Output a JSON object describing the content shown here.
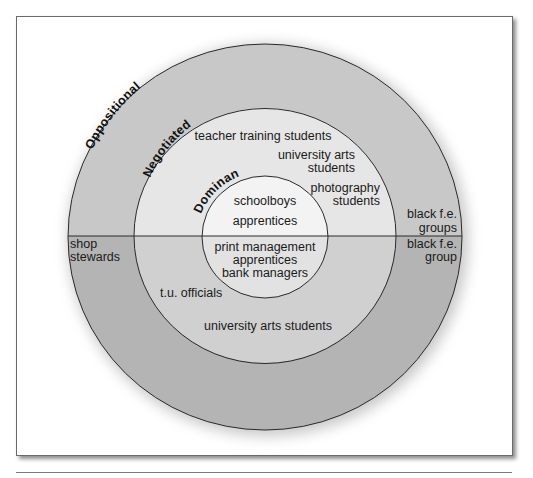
{
  "diagram": {
    "type": "concentric-circles",
    "rings": [
      {
        "name": "Oppositional",
        "label": "Oppositional"
      },
      {
        "name": "Negotiated",
        "label": "Negotiated"
      },
      {
        "name": "Dominant",
        "label": "Dominant"
      }
    ],
    "colors": {
      "outer_top": "#c8c8c8",
      "outer_bottom": "#b4b4b4",
      "middle_top": "#e6e6e6",
      "middle_bottom": "#d0d0d0",
      "inner_top": "#f3f3f3",
      "inner_bottom": "#e2e2e2",
      "stroke": "#2a2a2a"
    },
    "top_half": {
      "dominant": [
        "schoolboys",
        "apprentices"
      ],
      "negotiated": {
        "teacher": "teacher training students",
        "univ_line1": "university arts",
        "univ_line2": "students",
        "photo_line1": "photography",
        "photo_line2": "students"
      },
      "oppositional": {
        "line1": "black f.e.",
        "line2": "groups"
      }
    },
    "bottom_half": {
      "dominant": [
        "print management",
        "apprentices",
        "bank managers"
      ],
      "negotiated": {
        "tu": "t.u. officials",
        "univ": "university arts students"
      },
      "oppositional_left": {
        "line1": "shop",
        "line2": "stewards"
      },
      "oppositional_right": {
        "line1": "black f.e.",
        "line2": "group"
      }
    }
  }
}
